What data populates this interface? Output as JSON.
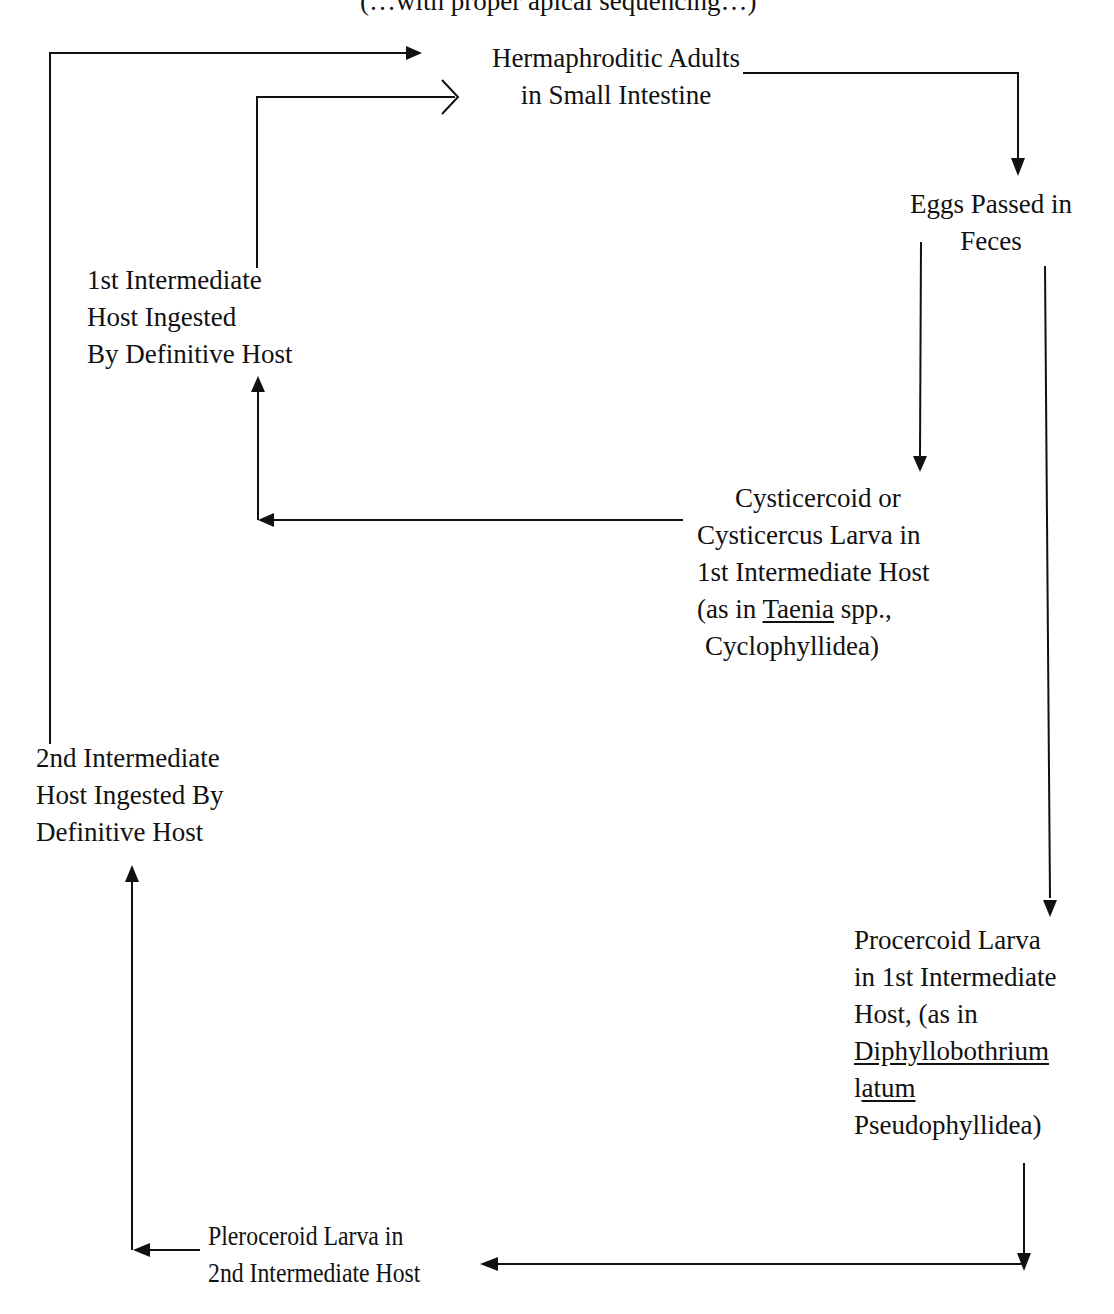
{
  "diagram": {
    "title_fragment": "(…with proper apical sequencing…)",
    "nodes": {
      "adults": {
        "lines": [
          "Hermaphroditic Adults",
          "in Small Intestine"
        ]
      },
      "eggs": {
        "lines": [
          "Eggs Passed in",
          "Feces"
        ]
      },
      "first_host_ingested": {
        "lines": [
          "1st Intermediate",
          "Host Ingested",
          "By Definitive Host"
        ]
      },
      "cysticercoid": {
        "lines": [
          "Cysticercoid or",
          "Cysticercus Larva in",
          "1st Intermediate Host"
        ],
        "line4_prefix": "(as in ",
        "line4_genus": "Taenia",
        "line4_suffix": " spp.,",
        "line5": "Cyclophyllidea)"
      },
      "second_host_ingested": {
        "lines": [
          "2nd Intermediate",
          "Host Ingested By",
          "Definitive Host"
        ]
      },
      "procercoid": {
        "lines": [
          "Procercoid Larva",
          "in 1st Intermediate",
          "Host, (as in"
        ],
        "genus": "Diphyllobothrium",
        "species_prefix": "l",
        "species_underlined": "atum",
        "order": "Pseudophyllidea)"
      },
      "pleroceroid": {
        "lines": [
          "Pleroceroid Larva in",
          "2nd Intermediate Host"
        ]
      }
    },
    "edges": [
      {
        "from": "adults",
        "to": "eggs",
        "arrow": "filled"
      },
      {
        "from": "eggs",
        "to": "cysticercoid",
        "arrow": "filled"
      },
      {
        "from": "cysticercoid",
        "to": "first_host_ingested",
        "arrow": "filled"
      },
      {
        "from": "first_host_ingested",
        "to": "adults",
        "arrow": "open"
      },
      {
        "from": "eggs",
        "to": "procercoid",
        "arrow": "filled"
      },
      {
        "from": "procercoid",
        "to": "pleroceroid",
        "arrow": "filled"
      },
      {
        "from": "pleroceroid",
        "to": "second_host_ingested",
        "arrow": "filled"
      },
      {
        "from": "second_host_ingested",
        "to": "adults",
        "arrow": "filled"
      }
    ],
    "colors": {
      "line": "#111111",
      "background": "#ffffff"
    }
  }
}
